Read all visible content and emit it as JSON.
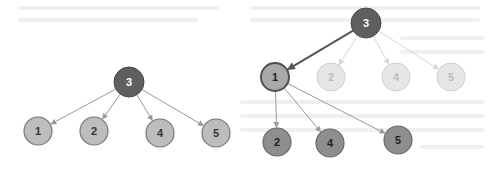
{
  "diagram": {
    "type": "tree-comparison",
    "colors": {
      "root_fill": "#5f5f5f",
      "root_stroke": "#4a4a4a",
      "child_fill": "#bdbdbd",
      "child_stroke": "#777777",
      "selected_fill": "#a9a9a9",
      "selected_stroke": "#505050",
      "faded_fill": "#e6e6e6",
      "faded_stroke": "#cfcfcf",
      "faded_text": "#bcbcbc",
      "grandchild_fill": "#8e8e8e",
      "grandchild_stroke": "#6a6a6a",
      "edge": "#9a9a9a",
      "edge_faded": "#d6d6d6",
      "edge_bold": "#555555"
    },
    "left_tree": {
      "root": {
        "label": "3",
        "x": 129,
        "y": 82
      },
      "children": [
        {
          "label": "1",
          "x": 38,
          "y": 131
        },
        {
          "label": "2",
          "x": 94,
          "y": 131
        },
        {
          "label": "4",
          "x": 160,
          "y": 133
        },
        {
          "label": "5",
          "x": 216,
          "y": 133
        }
      ]
    },
    "right_tree": {
      "root": {
        "label": "3",
        "x": 366,
        "y": 23
      },
      "children": [
        {
          "label": "1",
          "x": 275,
          "y": 77,
          "state": "selected"
        },
        {
          "label": "2",
          "x": 331,
          "y": 77,
          "state": "faded"
        },
        {
          "label": "4",
          "x": 396,
          "y": 77,
          "state": "faded"
        },
        {
          "label": "5",
          "x": 451,
          "y": 77,
          "state": "faded"
        }
      ],
      "grandchildren": [
        {
          "label": "2",
          "x": 277,
          "y": 142
        },
        {
          "label": "4",
          "x": 330,
          "y": 143
        },
        {
          "label": "5",
          "x": 398,
          "y": 140
        }
      ]
    }
  }
}
